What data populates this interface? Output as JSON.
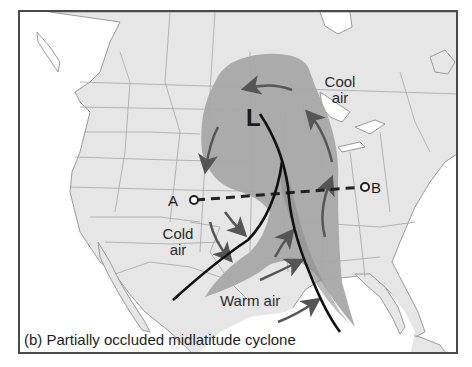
{
  "figure": {
    "caption": "(b) Partially occluded midlatitude cyclone",
    "low_pressure_symbol": "L",
    "cross_section": {
      "start_label": "A",
      "end_label": "B"
    },
    "air_mass_labels": {
      "cool_line1": "Cool",
      "cool_line2": "air",
      "cold_line1": "Cold",
      "cold_line2": "air",
      "warm": "Warm air"
    },
    "colors": {
      "land": "#e6e6e6",
      "water": "#ffffff",
      "borders": "#9a9a9a",
      "cyclone_shading": "#a8a8a8",
      "front_shading": "#b5b5b5",
      "front_line": "#111111",
      "arrows": "#555555",
      "frame": "#4a4a4a"
    }
  }
}
